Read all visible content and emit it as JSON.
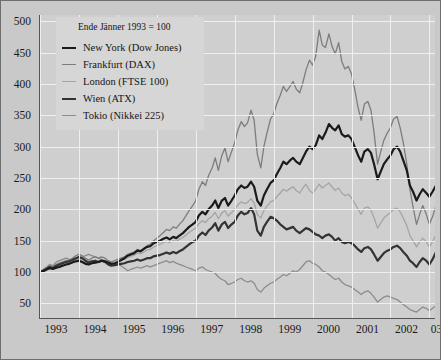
{
  "legend": {
    "note": "Ende Jänner 1993 = 100",
    "entries": [
      {
        "label": "New York (Dow Jones)",
        "color": "#1a1a1a",
        "width": 2.2
      },
      {
        "label": "Frankfurt (DAX)",
        "color": "#7d7d7d",
        "width": 1.3
      },
      {
        "label": "London (FTSE 100)",
        "color": "#a5a5a5",
        "width": 1.3
      },
      {
        "label": "Wien (ATX)",
        "color": "#333333",
        "width": 2.2
      },
      {
        "label": "Tokio (Nikkei 225)",
        "color": "#8c8c8c",
        "width": 1.3
      }
    ]
  },
  "axes": {
    "y_ticks": [
      50,
      100,
      150,
      200,
      250,
      300,
      350,
      400,
      450,
      500
    ],
    "x_ticks": [
      "1993",
      "1994",
      "1995",
      "1996",
      "1997",
      "1998",
      "1999",
      "2000",
      "2001",
      "2002",
      "03"
    ]
  },
  "colors": {
    "page_background": "#c9c9c9",
    "plot_background": "#cfcfcf",
    "gridline": "#efefef",
    "axis": "#555555",
    "legend_background": "#d6d6d6",
    "text": "#1a1a1a"
  },
  "chart_data": {
    "type": "line",
    "title": "",
    "subtitle": "Ende Jänner 1993 = 100",
    "xlabel": "",
    "ylabel": "",
    "xlim": [
      1993.0,
      2003.17
    ],
    "ylim": [
      25,
      510
    ],
    "y_ticks": [
      50,
      100,
      150,
      200,
      250,
      300,
      350,
      400,
      450,
      500
    ],
    "x_ticks": [
      1993,
      1994,
      1995,
      1996,
      1997,
      1998,
      1999,
      2000,
      2001,
      2002,
      2003
    ],
    "x_tick_labels": [
      "1993",
      "1994",
      "1995",
      "1996",
      "1997",
      "1998",
      "1999",
      "2000",
      "2001",
      "2002",
      "03"
    ],
    "grid": true,
    "legend_position": "upper-left",
    "index_base": "Ende Jänner 1993 = 100",
    "x": [
      1993.0,
      1993.08,
      1993.17,
      1993.25,
      1993.33,
      1993.42,
      1993.5,
      1993.58,
      1993.67,
      1993.75,
      1993.83,
      1993.92,
      1994.0,
      1994.08,
      1994.17,
      1994.25,
      1994.33,
      1994.42,
      1994.5,
      1994.58,
      1994.67,
      1994.75,
      1994.83,
      1994.92,
      1995.0,
      1995.08,
      1995.17,
      1995.25,
      1995.33,
      1995.42,
      1995.5,
      1995.58,
      1995.67,
      1995.75,
      1995.83,
      1995.92,
      1996.0,
      1996.08,
      1996.17,
      1996.25,
      1996.33,
      1996.42,
      1996.5,
      1996.58,
      1996.67,
      1996.75,
      1996.83,
      1996.92,
      1997.0,
      1997.08,
      1997.17,
      1997.25,
      1997.33,
      1997.42,
      1997.5,
      1997.58,
      1997.67,
      1997.75,
      1997.83,
      1997.92,
      1998.0,
      1998.08,
      1998.17,
      1998.25,
      1998.33,
      1998.42,
      1998.5,
      1998.58,
      1998.67,
      1998.75,
      1998.83,
      1998.92,
      1999.0,
      1999.08,
      1999.17,
      1999.25,
      1999.33,
      1999.42,
      1999.5,
      1999.58,
      1999.67,
      1999.75,
      1999.83,
      1999.92,
      2000.0,
      2000.08,
      2000.17,
      2000.25,
      2000.33,
      2000.42,
      2000.5,
      2000.58,
      2000.67,
      2000.75,
      2000.83,
      2000.92,
      2001.0,
      2001.08,
      2001.17,
      2001.25,
      2001.33,
      2001.42,
      2001.5,
      2001.58,
      2001.67,
      2001.75,
      2001.83,
      2001.92,
      2002.0,
      2002.08,
      2002.17,
      2002.25,
      2002.33,
      2002.42,
      2002.5,
      2002.58,
      2002.67,
      2002.75,
      2002.83,
      2002.92,
      2003.0,
      2003.08,
      2003.17
    ],
    "series": [
      {
        "name": "New York (Dow Jones)",
        "color": "#1a1a1a",
        "width": 2.2,
        "values": [
          100,
          101,
          104,
          106,
          105,
          107,
          108,
          110,
          112,
          113,
          115,
          117,
          118,
          116,
          113,
          112,
          114,
          115,
          116,
          118,
          117,
          115,
          113,
          114,
          116,
          119,
          122,
          126,
          128,
          130,
          134,
          133,
          137,
          140,
          141,
          146,
          148,
          150,
          153,
          155,
          152,
          156,
          154,
          158,
          162,
          167,
          172,
          176,
          180,
          190,
          196,
          192,
          200,
          206,
          214,
          202,
          214,
          218,
          206,
          214,
          222,
          232,
          238,
          234,
          236,
          244,
          236,
          214,
          206,
          222,
          232,
          242,
          246,
          256,
          266,
          276,
          272,
          278,
          282,
          276,
          272,
          282,
          292,
          300,
          296,
          302,
          318,
          312,
          322,
          336,
          330,
          326,
          334,
          320,
          316,
          318,
          312,
          300,
          286,
          276,
          292,
          296,
          290,
          272,
          248,
          260,
          272,
          280,
          286,
          296,
          300,
          292,
          278,
          262,
          238,
          228,
          214,
          224,
          232,
          226,
          220,
          228,
          238
        ]
      },
      {
        "name": "Frankfurt (DAX)",
        "color": "#7d7d7d",
        "width": 1.3,
        "values": [
          100,
          103,
          107,
          110,
          108,
          112,
          114,
          116,
          118,
          119,
          122,
          126,
          128,
          126,
          122,
          119,
          122,
          124,
          122,
          124,
          122,
          118,
          116,
          118,
          120,
          122,
          124,
          128,
          130,
          132,
          136,
          134,
          138,
          142,
          144,
          150,
          154,
          158,
          163,
          168,
          166,
          172,
          170,
          176,
          182,
          190,
          198,
          206,
          214,
          232,
          244,
          238,
          254,
          266,
          282,
          262,
          286,
          298,
          276,
          292,
          306,
          326,
          340,
          332,
          338,
          358,
          342,
          288,
          266,
          300,
          322,
          344,
          352,
          368,
          382,
          396,
          388,
          396,
          404,
          392,
          386,
          402,
          422,
          438,
          430,
          444,
          486,
          462,
          458,
          480,
          460,
          448,
          466,
          436,
          424,
          428,
          416,
          392,
          362,
          342,
          368,
          372,
          358,
          322,
          272,
          292,
          310,
          322,
          330,
          344,
          348,
          330,
          306,
          272,
          232,
          204,
          176,
          192,
          206,
          192,
          176,
          188,
          206
        ]
      },
      {
        "name": "London (FTSE 100)",
        "color": "#a5a5a5",
        "width": 1.3,
        "values": [
          100,
          102,
          105,
          107,
          106,
          108,
          110,
          111,
          113,
          114,
          116,
          119,
          120,
          118,
          115,
          113,
          115,
          116,
          116,
          118,
          117,
          115,
          113,
          114,
          116,
          118,
          120,
          123,
          125,
          127,
          130,
          129,
          132,
          135,
          136,
          140,
          142,
          144,
          147,
          149,
          147,
          150,
          149,
          152,
          155,
          159,
          163,
          167,
          170,
          177,
          182,
          179,
          185,
          189,
          195,
          185,
          194,
          198,
          189,
          195,
          200,
          207,
          212,
          209,
          211,
          217,
          210,
          192,
          186,
          198,
          205,
          212,
          214,
          220,
          226,
          232,
          229,
          233,
          236,
          230,
          226,
          234,
          240,
          230,
          226,
          232,
          240,
          234,
          238,
          242,
          236,
          230,
          234,
          226,
          222,
          224,
          218,
          210,
          200,
          192,
          202,
          204,
          199,
          186,
          170,
          178,
          186,
          191,
          195,
          200,
          202,
          196,
          186,
          174,
          158,
          150,
          140,
          148,
          154,
          148,
          140,
          148,
          160
        ]
      },
      {
        "name": "Wien (ATX)",
        "color": "#333333",
        "width": 2.2,
        "values": [
          100,
          102,
          105,
          108,
          106,
          110,
          112,
          114,
          116,
          117,
          119,
          122,
          124,
          122,
          118,
          115,
          117,
          118,
          116,
          118,
          116,
          112,
          110,
          111,
          112,
          113,
          114,
          116,
          117,
          118,
          120,
          118,
          120,
          122,
          122,
          125,
          126,
          127,
          129,
          131,
          129,
          132,
          130,
          133,
          136,
          140,
          144,
          148,
          150,
          158,
          163,
          159,
          166,
          171,
          178,
          166,
          176,
          180,
          170,
          176,
          180,
          190,
          196,
          192,
          194,
          202,
          192,
          166,
          158,
          172,
          180,
          188,
          186,
          182,
          176,
          172,
          168,
          170,
          172,
          166,
          162,
          166,
          170,
          168,
          164,
          160,
          158,
          154,
          158,
          160,
          156,
          150,
          154,
          148,
          146,
          148,
          146,
          142,
          136,
          132,
          138,
          140,
          136,
          128,
          118,
          124,
          130,
          134,
          136,
          140,
          142,
          138,
          132,
          126,
          118,
          114,
          108,
          116,
          122,
          118,
          112,
          120,
          132
        ]
      },
      {
        "name": "Tokio (Nikkei 225)",
        "color": "#8c8c8c",
        "width": 1.3,
        "values": [
          100,
          104,
          108,
          112,
          110,
          116,
          118,
          120,
          122,
          120,
          118,
          120,
          122,
          124,
          126,
          128,
          126,
          124,
          122,
          120,
          118,
          115,
          112,
          113,
          114,
          110,
          106,
          102,
          104,
          106,
          108,
          106,
          108,
          110,
          108,
          110,
          112,
          114,
          116,
          118,
          115,
          117,
          114,
          112,
          110,
          108,
          106,
          104,
          102,
          106,
          108,
          104,
          102,
          100,
          98,
          92,
          88,
          86,
          80,
          82,
          84,
          88,
          90,
          86,
          84,
          86,
          82,
          72,
          68,
          74,
          78,
          82,
          84,
          88,
          92,
          96,
          94,
          98,
          102,
          100,
          104,
          110,
          116,
          118,
          114,
          112,
          108,
          102,
          100,
          96,
          92,
          88,
          90,
          84,
          80,
          78,
          76,
          72,
          68,
          64,
          68,
          70,
          66,
          60,
          52,
          56,
          60,
          62,
          60,
          58,
          56,
          52,
          48,
          44,
          40,
          38,
          36,
          40,
          44,
          42,
          38,
          42,
          46
        ]
      }
    ]
  }
}
